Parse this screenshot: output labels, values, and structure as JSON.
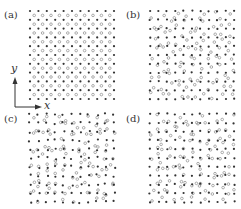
{
  "figure": {
    "axes": {
      "x_label": "x",
      "y_label": "y"
    },
    "panels": [
      {
        "id": "a",
        "label": "(a)",
        "filled_per_row": 11,
        "open_per_row": 10,
        "filled_rows": 11,
        "disorder": 0.0,
        "open_disorder": 0.0
      },
      {
        "id": "b",
        "label": "(b)",
        "filled_per_row": 11,
        "open_per_row": 10,
        "filled_rows": 11,
        "disorder": 0.05,
        "open_disorder": 0.45
      },
      {
        "id": "c",
        "label": "(c)",
        "filled_per_row": 11,
        "open_per_row": 10,
        "filled_rows": 11,
        "disorder": 0.15,
        "open_disorder": 0.6
      },
      {
        "id": "d",
        "label": "(d)",
        "filled_per_row": 11,
        "open_per_row": 10,
        "filled_rows": 11,
        "disorder": 0.08,
        "open_disorder": 0.5
      }
    ],
    "colors": {
      "filled": "#333333",
      "open_stroke": "#8a8a8a",
      "axis": "#333333"
    }
  }
}
